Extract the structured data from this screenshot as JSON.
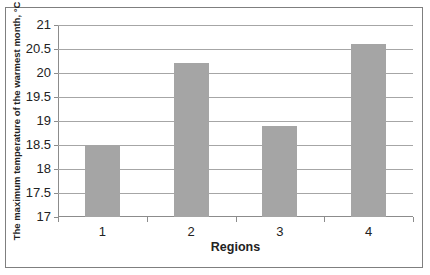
{
  "chart_data": {
    "type": "bar",
    "title": "",
    "xlabel": "Regions",
    "ylabel": "The maximum  temperature of the warmest month, °C",
    "categories": [
      "1",
      "2",
      "3",
      "4"
    ],
    "values": [
      18.5,
      20.2,
      18.9,
      20.6
    ],
    "ylim": [
      17,
      21
    ],
    "yticks": [
      "17",
      "17.5",
      "18",
      "18.5",
      "19",
      "19.5",
      "20",
      "20.5",
      "21"
    ],
    "grid": true,
    "legend": "none",
    "bar_color": "#a5a5a5"
  }
}
